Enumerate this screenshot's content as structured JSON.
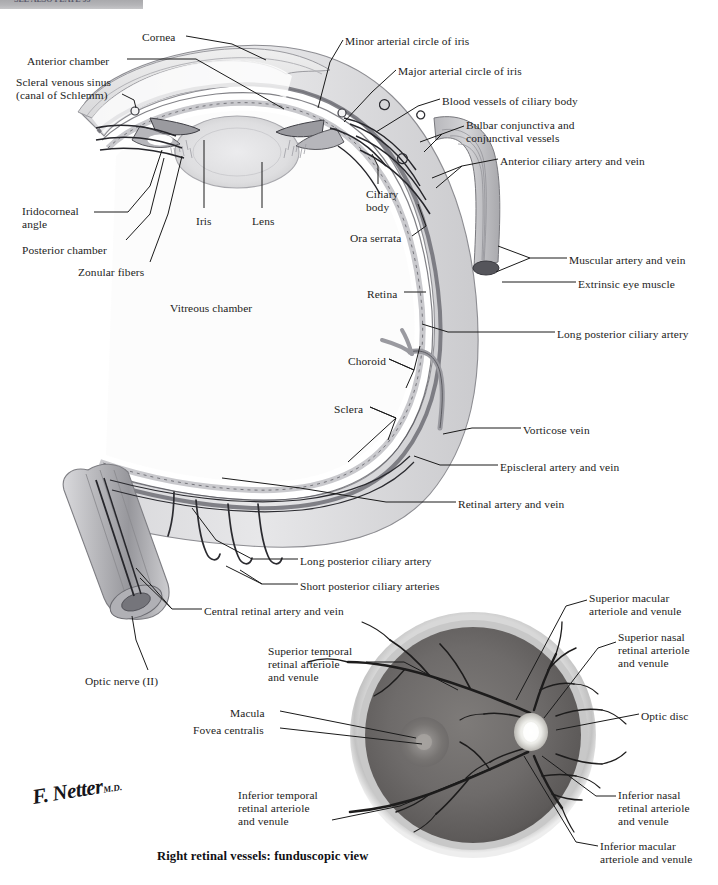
{
  "plate": {
    "banner_text": "SEE ALSO PLATE 95"
  },
  "figure": {
    "title": "Right retinal vessels: funduscopic view",
    "signature": "F. Netter",
    "signature_suffix": "M.D."
  },
  "colors": {
    "background": "#ffffff",
    "banner": "#b4b4b7",
    "label_text": "#1c1c22",
    "leader_line": "#1a1a1a",
    "sclera_outer": "#cfcfd2",
    "sclera_fill": "#e3e3e5",
    "choroid": "#8e8e93",
    "retina_band": "#b9b9bd",
    "vitreous": "#fbfbfb",
    "lens": "#dcdcde",
    "cornea": "#e8e8ea",
    "vessel": "#2b2b30",
    "muscle": "#b3b3b7",
    "fundus_retina": "#6d6b6b",
    "fundus_rim": "#cfcfd0",
    "fundus_disc": "#f2f1ee",
    "fundus_macula": "#8a8785",
    "fundus_vessel": "#1d1c1c"
  },
  "cross_section_labels": [
    {
      "id": "cornea",
      "text": "Cornea",
      "x": 142,
      "y": 31,
      "align": "left"
    },
    {
      "id": "anterior-chamber",
      "text": "Anterior chamber",
      "x": 27,
      "y": 55,
      "align": "left"
    },
    {
      "id": "scleral-venous-sinus",
      "text": "Scleral venous sinus\n(canal of Schlemm)",
      "x": 16,
      "y": 76,
      "align": "left"
    },
    {
      "id": "minor-arterial-circle",
      "text": "Minor arterial circle of iris",
      "x": 345,
      "y": 35,
      "align": "left"
    },
    {
      "id": "major-arterial-circle",
      "text": "Major arterial circle of iris",
      "x": 398,
      "y": 65,
      "align": "left"
    },
    {
      "id": "blood-vessels-ciliary",
      "text": "Blood vessels of ciliary body",
      "x": 442,
      "y": 95,
      "align": "left"
    },
    {
      "id": "bulbar-conjunctiva",
      "text": "Bulbar conjunctiva and\nconjunctival vessels",
      "x": 466,
      "y": 119,
      "align": "left"
    },
    {
      "id": "anterior-ciliary",
      "text": "Anterior ciliary artery and vein",
      "x": 500,
      "y": 155,
      "align": "left"
    },
    {
      "id": "iridocorneal-angle",
      "text": "Iridocorneal\nangle",
      "x": 22,
      "y": 205,
      "align": "left"
    },
    {
      "id": "posterior-chamber",
      "text": "Posterior chamber",
      "x": 22,
      "y": 244,
      "align": "left"
    },
    {
      "id": "zonular-fibers",
      "text": "Zonular fibers",
      "x": 78,
      "y": 266,
      "align": "left"
    },
    {
      "id": "iris",
      "text": "Iris",
      "x": 196,
      "y": 215,
      "align": "left"
    },
    {
      "id": "lens",
      "text": "Lens",
      "x": 252,
      "y": 215,
      "align": "left"
    },
    {
      "id": "vitreous-chamber",
      "text": "Vitreous chamber",
      "x": 170,
      "y": 302,
      "align": "left"
    },
    {
      "id": "ciliary-body",
      "text": "Ciliary\nbody",
      "x": 366,
      "y": 188,
      "align": "left"
    },
    {
      "id": "ora-serrata",
      "text": "Ora serrata",
      "x": 350,
      "y": 232,
      "align": "left"
    },
    {
      "id": "muscular-artery-vein",
      "text": "Muscular artery and vein",
      "x": 569,
      "y": 254,
      "align": "left"
    },
    {
      "id": "extrinsic-eye-muscle",
      "text": "Extrinsic eye muscle",
      "x": 578,
      "y": 278,
      "align": "left"
    },
    {
      "id": "retina",
      "text": "Retina",
      "x": 367,
      "y": 288,
      "align": "left"
    },
    {
      "id": "long-post-ciliary-a",
      "text": "Long posterior ciliary artery",
      "x": 557,
      "y": 328,
      "align": "left"
    },
    {
      "id": "choroid",
      "text": "Choroid",
      "x": 348,
      "y": 355,
      "align": "left"
    },
    {
      "id": "sclera",
      "text": "Sclera",
      "x": 334,
      "y": 403,
      "align": "left"
    },
    {
      "id": "vorticose-vein",
      "text": "Vorticose vein",
      "x": 523,
      "y": 424,
      "align": "left"
    },
    {
      "id": "episcleral-artery-vein",
      "text": "Episcleral artery and vein",
      "x": 500,
      "y": 461,
      "align": "left"
    },
    {
      "id": "retinal-artery-vein",
      "text": "Retinal artery and vein",
      "x": 458,
      "y": 498,
      "align": "left"
    },
    {
      "id": "long-post-ciliary-a2",
      "text": "Long posterior ciliary artery",
      "x": 300,
      "y": 555,
      "align": "left"
    },
    {
      "id": "short-post-ciliary-a",
      "text": "Short posterior ciliary arteries",
      "x": 300,
      "y": 580,
      "align": "left"
    },
    {
      "id": "central-retinal-av",
      "text": "Central retinal artery and vein",
      "x": 204,
      "y": 605,
      "align": "left"
    },
    {
      "id": "optic-nerve",
      "text": "Optic nerve (II)",
      "x": 85,
      "y": 675,
      "align": "left"
    }
  ],
  "fundus_labels": [
    {
      "id": "superior-macular",
      "text": "Superior macular\narteriole and venule",
      "x": 589,
      "y": 592,
      "align": "left"
    },
    {
      "id": "superior-nasal",
      "text": "Superior nasal\nretinal arteriole\nand venule",
      "x": 618,
      "y": 631,
      "align": "left"
    },
    {
      "id": "superior-temporal",
      "text": "Superior temporal\nretinal arteriole\nand venule",
      "x": 268,
      "y": 645,
      "align": "left"
    },
    {
      "id": "optic-disc",
      "text": "Optic disc",
      "x": 641,
      "y": 710,
      "align": "left"
    },
    {
      "id": "macula",
      "text": "Macula",
      "x": 230,
      "y": 707,
      "align": "left"
    },
    {
      "id": "fovea-centralis",
      "text": "Fovea centralis",
      "x": 193,
      "y": 724,
      "align": "left"
    },
    {
      "id": "inferior-temporal",
      "text": "Inferior temporal\nretinal arteriole\nand venule",
      "x": 238,
      "y": 789,
      "align": "left"
    },
    {
      "id": "inferior-nasal",
      "text": "Inferior nasal\nretinal arteriole\nand venule",
      "x": 618,
      "y": 789,
      "align": "left"
    },
    {
      "id": "inferior-macular",
      "text": "Inferior macular\narteriole and venule",
      "x": 600,
      "y": 840,
      "align": "left"
    }
  ]
}
